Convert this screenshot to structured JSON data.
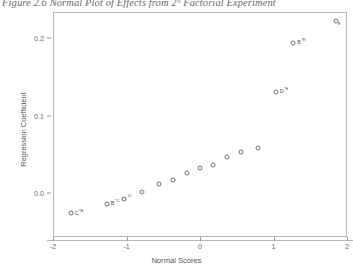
{
  "caption": "Figure 2.6  Normal Plot of Effects from 2⁵ Factorial Experiment",
  "chart_data": {
    "type": "scatter",
    "title": "",
    "xlabel": "Normal Scores",
    "ylabel": "Regression Coefficient",
    "xlim": [
      -2,
      2
    ],
    "ylim": [
      -0.032,
      0.235
    ],
    "xticks": [
      -2,
      -1,
      0,
      1,
      2
    ],
    "xticklabels": [
      "-2",
      "-1",
      "0",
      "1",
      "2"
    ],
    "yticks": [
      0.0,
      0.1,
      0.2
    ],
    "yticklabels": [
      "0.0",
      "0.1",
      "0.2"
    ],
    "grid": false,
    "legend": "none",
    "marker": "open-circle",
    "points": [
      {
        "x": -1.76,
        "y": -0.0255,
        "label": "C*E",
        "lx": 4,
        "ly": -1
      },
      {
        "x": -1.27,
        "y": -0.0145,
        "label": "B*C",
        "lx": 4,
        "ly": -2
      },
      {
        "x": -1.03,
        "y": -0.0075,
        "label": "D",
        "lx": 4,
        "ly": -2
      },
      {
        "x": -0.79,
        "y": 0.0015,
        "label": "",
        "lx": 0,
        "ly": 0
      },
      {
        "x": -0.56,
        "y": 0.0115,
        "label": "",
        "lx": 0,
        "ly": 0
      },
      {
        "x": -0.37,
        "y": 0.0165,
        "label": "",
        "lx": 0,
        "ly": 0
      },
      {
        "x": -0.18,
        "y": 0.0255,
        "label": "",
        "lx": 0,
        "ly": 0
      },
      {
        "x": 0.0,
        "y": 0.032,
        "label": "",
        "lx": 0,
        "ly": 0
      },
      {
        "x": 0.18,
        "y": 0.0355,
        "label": "",
        "lx": 0,
        "ly": 0
      },
      {
        "x": 0.37,
        "y": 0.047,
        "label": "",
        "lx": 0,
        "ly": 0
      },
      {
        "x": 0.56,
        "y": 0.053,
        "label": "",
        "lx": 0,
        "ly": 0
      },
      {
        "x": 0.79,
        "y": 0.058,
        "label": "",
        "lx": 0,
        "ly": 0
      },
      {
        "x": 1.03,
        "y": 0.1305,
        "label": "D*E",
        "lx": 4,
        "ly": -2
      },
      {
        "x": 1.27,
        "y": 0.194,
        "label": "B*E",
        "lx": 4,
        "ly": -2
      },
      {
        "x": 1.85,
        "y": 0.222,
        "label": "E",
        "lx": 2,
        "ly": 4
      }
    ]
  }
}
